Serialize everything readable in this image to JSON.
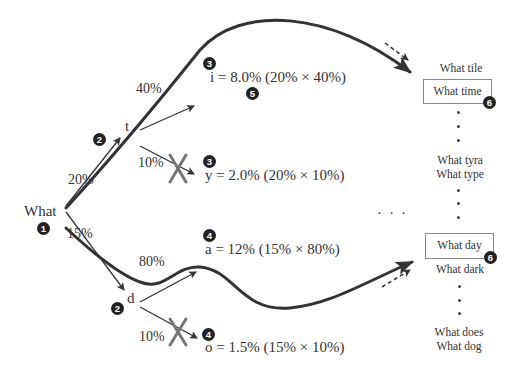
{
  "root": {
    "label": "What",
    "step": "1"
  },
  "branches": {
    "t": {
      "label": "t",
      "prob": "20%",
      "step": "2"
    },
    "d": {
      "label": "d",
      "prob": "15%",
      "step": "2"
    }
  },
  "leaves": {
    "i": {
      "prob": "40%",
      "formula": "i = 8.0% (20% × 40%)",
      "step": "3",
      "extra_step": "5",
      "pruned": false
    },
    "y": {
      "prob": "10%",
      "formula": "y = 2.0% (20% × 10%)",
      "step": "3",
      "pruned": true
    },
    "a": {
      "prob": "80%",
      "formula": "a = 12% (15% × 80%)",
      "step": "4",
      "pruned": false
    },
    "o": {
      "prob": "10%",
      "formula": "o = 1.5% (15% × 10%)",
      "step": "4",
      "pruned": true
    }
  },
  "ellipsis": "· · ·",
  "results": {
    "top": [
      {
        "label": "What tile",
        "boxed": false
      },
      {
        "label": "What time",
        "boxed": true,
        "step": "6"
      },
      {
        "label": "What tyra",
        "boxed": false
      },
      {
        "label": "What type",
        "boxed": false
      }
    ],
    "bottom": [
      {
        "label": "What day",
        "boxed": true,
        "step": "6"
      },
      {
        "label": "What dark",
        "boxed": false
      },
      {
        "label": "What does",
        "boxed": false
      },
      {
        "label": "What dog",
        "boxed": false
      }
    ]
  },
  "colors": {
    "line": "#333333",
    "cross": "#777777",
    "badge": "#222222",
    "box_border": "#888888"
  }
}
